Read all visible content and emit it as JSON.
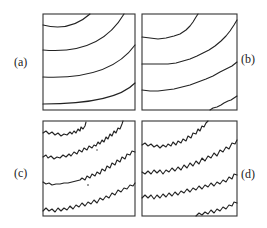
{
  "figure": {
    "panels": [
      {
        "id": "a",
        "label": "(a)",
        "style": "smooth",
        "label_side": "left"
      },
      {
        "id": "b",
        "label": "(b)",
        "style": "slightly-rough",
        "label_side": "right"
      },
      {
        "id": "c",
        "label": "(c)",
        "style": "rough",
        "label_side": "left"
      },
      {
        "id": "d",
        "label": "(d)",
        "style": "very-rough",
        "label_side": "right"
      }
    ],
    "colors": {
      "line": "#222222",
      "frame": "#333333",
      "background": "#ffffff"
    }
  }
}
